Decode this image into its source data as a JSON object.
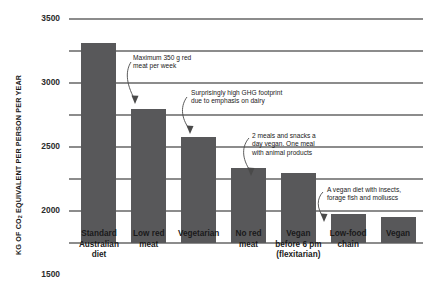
{
  "chart_data": {
    "type": "bar",
    "title": "",
    "xlabel": "",
    "ylabel": "KG OF CO2 EQUIVALENT PER PERSON PER YEAR",
    "ylabel_parts": {
      "pre": "KG OF CO",
      "sub": "2",
      "post": " EQUIVALENT PER PERSON PER YEAR"
    },
    "ylim": [
      0,
      3500
    ],
    "ytick_values": [
      0,
      500,
      1000,
      1500,
      2000,
      2500,
      3000,
      3500
    ],
    "ytick_labels": [
      "0",
      "500",
      "1000",
      "1500",
      "2000",
      "2500",
      "3000",
      "3500"
    ],
    "grid": true,
    "legend": "none",
    "bar_color": "#58585a",
    "grid_color": "#8c8c8c",
    "categories": [
      "Standard\nAustralian\ndiet",
      "Low red\nmeat",
      "Vegetarian",
      "No red\nmeat",
      "Vegan\nbefore 6 pm\n(flexitarian)",
      "Low-food\nchain",
      "Vegan"
    ],
    "values": [
      3120,
      2100,
      1660,
      1170,
      1100,
      450,
      400
    ],
    "annotations": [
      "Maximum 350 g red\nmeat per week",
      "Surprisingly high GHG footprint\ndue to emphasis on dairy",
      "2 meals and snacks a\nday vegan. One meal\nwith animal products",
      "A vegan diet with insects,\nforage fish and molluscs"
    ]
  }
}
